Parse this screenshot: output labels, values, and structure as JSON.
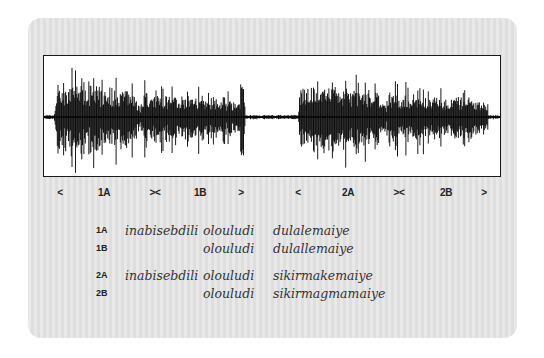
{
  "waveform": {
    "frame": {
      "x": 43,
      "y": 55,
      "width": 458,
      "height": 122
    },
    "centerline_y": 61,
    "segments": [
      {
        "name": "phrase-1",
        "start": 10,
        "end": 201,
        "peak": 55,
        "decay": 0.55
      },
      {
        "name": "phrase-2",
        "start": 254,
        "end": 444,
        "peak": 52,
        "decay": 0.5
      }
    ],
    "quiet_amplitude": 1.5,
    "color": "#000000"
  },
  "markers": [
    {
      "label": "<",
      "x": 60
    },
    {
      "label": "1A",
      "x": 104
    },
    {
      "label": "><",
      "x": 155
    },
    {
      "label": "1B",
      "x": 200
    },
    {
      "label": ">",
      "x": 241
    },
    {
      "label": "<",
      "x": 298
    },
    {
      "label": "2A",
      "x": 348
    },
    {
      "label": "><",
      "x": 399
    },
    {
      "label": "2B",
      "x": 446
    },
    {
      "label": ">",
      "x": 484
    }
  ],
  "transcription": [
    {
      "label": "1A",
      "y": 230,
      "words": [
        "inabisebdili",
        "olouludi",
        "dulalemaiye"
      ]
    },
    {
      "label": "1B",
      "y": 248,
      "words": [
        "",
        "olouludi",
        "dulallemaiye"
      ]
    },
    {
      "label": "2A",
      "y": 275,
      "words": [
        "inabisebdili",
        "olouludi",
        "sikirmakemaiye"
      ]
    },
    {
      "label": "2B",
      "y": 293,
      "words": [
        "",
        "olouludi",
        "sikirmagmamaiye"
      ]
    }
  ],
  "columns": {
    "label_x": 96,
    "word_x": [
      125,
      203,
      273
    ]
  }
}
